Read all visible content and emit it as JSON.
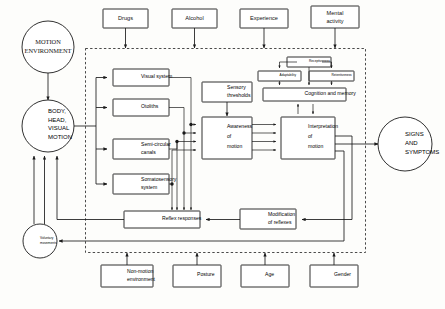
{
  "diagram": {
    "frame_label": "dashed-boundary",
    "nodes": {
      "motion_environment": "MOTION\nENVIRONMENT",
      "motion_environment_l1": "MOTION",
      "motion_environment_l2": "ENVIRONMENT",
      "body_head_visual_motion_l1": "BODY,",
      "body_head_visual_motion_l2": "HEAD,",
      "body_head_visual_motion_l3": "VISUAL",
      "body_head_visual_motion_l4": "MOTION",
      "voluntary_movements_l1": "Voluntary",
      "voluntary_movements_l2": "movements",
      "signs_and_symptoms_l1": "SIGNS",
      "signs_and_symptoms_l2": "AND",
      "signs_and_symptoms_l3": "SYMPTOMS",
      "visual_system": "Visual system",
      "otoliths": "Otoliths",
      "semicircular_canals_l1": "Semi-circular",
      "semicircular_canals_l2": "canals",
      "somatosensory_system_l1": "Somatosensory",
      "somatosensory_system_l2": "system",
      "sensory_thresholds_l1": "Sensory",
      "sensory_thresholds_l2": "thresholds",
      "awareness_of_motion_l1": "Awareness",
      "awareness_of_motion_l2": "of",
      "awareness_of_motion_l3": "motion",
      "interpretation_of_motion_l1": "Interpretation",
      "interpretation_of_motion_l2": "of",
      "interpretation_of_motion_l3": "motion",
      "cognition_and_memory": "Cognition and memory",
      "receptiveness": "Receptiveness",
      "adaptability": "Adaptability",
      "retentiveness": "Retentiveness",
      "reflex_responses": "Reflex responses",
      "modification_of_reflexes_l1": "Modification",
      "modification_of_reflexes_l2": "of reflexes"
    },
    "top_inputs": [
      {
        "label": "Drugs"
      },
      {
        "label": "Alcohol"
      },
      {
        "label": "Experience"
      },
      {
        "label": "Mental\nactivity",
        "l1": "Mental",
        "l2": "activity"
      }
    ],
    "bottom_inputs": [
      {
        "label": "Non-motion\nenvironment",
        "l1": "Non-motion",
        "l2": "environment"
      },
      {
        "label": "Posture"
      },
      {
        "label": "Age"
      },
      {
        "label": "Gender"
      }
    ],
    "colors": {
      "stroke": "#1a1a1a",
      "fill": "#ffffff",
      "background": "#fdfdfb",
      "dashed": "#2b2b2b"
    }
  }
}
